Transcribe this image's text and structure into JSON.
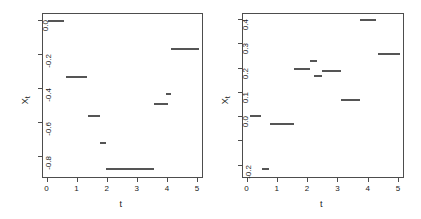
{
  "figure": {
    "background_color": "#ffffff",
    "axis_color": "#4d4d4d",
    "segment_color": "#555555"
  },
  "chart_data": [
    {
      "type": "line",
      "panel": "left",
      "title": "",
      "xlabel": "t",
      "ylabel": "X",
      "ylabel_sub": "t",
      "xlim": [
        -0.15,
        5.2
      ],
      "ylim": [
        -0.93,
        0.04
      ],
      "grid": false,
      "legend": null,
      "xticks": [
        0,
        1,
        2,
        3,
        4,
        5
      ],
      "xticklabels": [
        "0",
        "1",
        "2",
        "3",
        "4",
        "5"
      ],
      "yticks": [
        0.0,
        -0.2,
        -0.4,
        -0.6,
        -0.8
      ],
      "yticklabels": [
        "0.0",
        "-0.2",
        "-0.4",
        "-0.6",
        "-0.8"
      ],
      "style": "horizontal step segments",
      "segments": [
        {
          "x0": 0.02,
          "x1": 0.55,
          "y": 0.0
        },
        {
          "x0": 0.62,
          "x1": 1.3,
          "y": -0.33
        },
        {
          "x0": 1.33,
          "x1": 1.75,
          "y": -0.56
        },
        {
          "x0": 1.74,
          "x1": 1.95,
          "y": -0.72
        },
        {
          "x0": 1.95,
          "x1": 3.55,
          "y": -0.87
        },
        {
          "x0": 3.55,
          "x1": 4.02,
          "y": -0.49
        },
        {
          "x0": 3.95,
          "x1": 4.12,
          "y": -0.43
        },
        {
          "x0": 4.1,
          "x1": 5.02,
          "y": -0.165
        }
      ]
    },
    {
      "type": "line",
      "panel": "right",
      "title": "",
      "xlabel": "t",
      "ylabel": "X",
      "ylabel_sub": "t",
      "xlim": [
        -0.15,
        5.2
      ],
      "ylim": [
        -0.255,
        0.425
      ],
      "grid": false,
      "legend": null,
      "xticks": [
        0,
        1,
        2,
        3,
        4,
        5
      ],
      "xticklabels": [
        "0",
        "1",
        "2",
        "3",
        "4",
        "5"
      ],
      "yticks": [
        0.4,
        0.3,
        0.2,
        0.1,
        0.0,
        -0.1,
        -0.2
      ],
      "yticklabels": [
        "0.4",
        "0.3",
        "0.2",
        "0.1",
        "0.0",
        "",
        "-0.2"
      ],
      "style": "horizontal step segments",
      "segments": [
        {
          "x0": 0.08,
          "x1": 0.45,
          "y": 0.005
        },
        {
          "x0": 0.48,
          "x1": 0.7,
          "y": -0.215
        },
        {
          "x0": 0.75,
          "x1": 1.55,
          "y": -0.03
        },
        {
          "x0": 1.55,
          "x1": 2.05,
          "y": 0.2
        },
        {
          "x0": 2.05,
          "x1": 2.3,
          "y": 0.23
        },
        {
          "x0": 2.2,
          "x1": 2.45,
          "y": 0.17
        },
        {
          "x0": 2.45,
          "x1": 3.1,
          "y": 0.19
        },
        {
          "x0": 3.1,
          "x1": 3.7,
          "y": 0.07
        },
        {
          "x0": 3.7,
          "x1": 4.25,
          "y": 0.4
        },
        {
          "x0": 4.3,
          "x1": 5.05,
          "y": 0.26
        }
      ]
    }
  ]
}
